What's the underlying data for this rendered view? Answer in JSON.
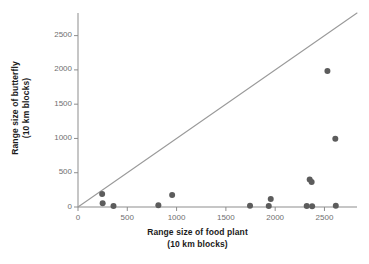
{
  "chart_data": {
    "type": "scatter",
    "title": "",
    "xlabel": "Range size of food plant",
    "xlabel_units": "(10 km blocks)",
    "ylabel": "Range size of butterfly",
    "ylabel_units": "(10 km blocks)",
    "xlim": [
      0,
      2830
    ],
    "ylim": [
      0,
      2830
    ],
    "xticks": [
      0,
      500,
      1000,
      1500,
      2000,
      2500
    ],
    "yticks": [
      0,
      500,
      1000,
      1500,
      2000,
      2500
    ],
    "xtick_labels": [
      "0",
      "500",
      "1000",
      "1500",
      "2000",
      "2500"
    ],
    "ytick_labels": [
      "0",
      "500",
      "1000",
      "1500",
      "2000",
      "2500"
    ],
    "grid": false,
    "legend": null,
    "marker_color": "#5c5c5c",
    "marker_size": 4.2,
    "axis_color": "#8d8d8d",
    "reference_line": {
      "name": "one-to-one-line",
      "from": [
        0,
        0
      ],
      "to": [
        2830,
        2830
      ],
      "color": "#9a9a9a",
      "width": 1.1
    },
    "points": [
      {
        "x": 245,
        "y": 190
      },
      {
        "x": 250,
        "y": 55
      },
      {
        "x": 360,
        "y": 15
      },
      {
        "x": 815,
        "y": 25
      },
      {
        "x": 955,
        "y": 175
      },
      {
        "x": 1745,
        "y": 20
      },
      {
        "x": 1935,
        "y": 15
      },
      {
        "x": 1955,
        "y": 115
      },
      {
        "x": 2320,
        "y": 15
      },
      {
        "x": 2350,
        "y": 400
      },
      {
        "x": 2370,
        "y": 365
      },
      {
        "x": 2375,
        "y": 10
      },
      {
        "x": 2530,
        "y": 1985
      },
      {
        "x": 2610,
        "y": 995
      },
      {
        "x": 2615,
        "y": 20
      }
    ]
  },
  "axes": {
    "x_axis_name": "x-axis",
    "y_axis_name": "y-axis"
  }
}
